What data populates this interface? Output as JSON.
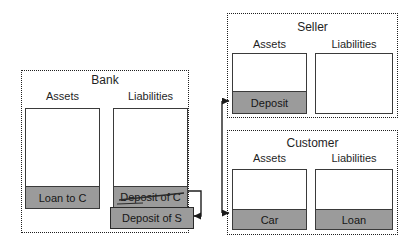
{
  "diagram": {
    "type": "balance-sheet-diagram",
    "groups": [
      {
        "title": "Bank",
        "columns": [
          {
            "header": "Assets",
            "items": [
              {
                "label": "Loan to C",
                "struck": false
              }
            ]
          },
          {
            "header": "Liabilities",
            "items": [
              {
                "label": "Deposit of C",
                "struck": true
              },
              {
                "label": "Deposit of S",
                "struck": false
              }
            ]
          }
        ]
      },
      {
        "title": "Seller",
        "columns": [
          {
            "header": "Assets",
            "items": [
              {
                "label": "Deposit",
                "struck": false
              }
            ]
          },
          {
            "header": "Liabilities",
            "items": []
          }
        ]
      },
      {
        "title": "Customer",
        "columns": [
          {
            "header": "Assets",
            "items": [
              {
                "label": "Car",
                "struck": false
              }
            ]
          },
          {
            "header": "Liabilities",
            "items": [
              {
                "label": "Loan",
                "struck": false
              }
            ]
          }
        ]
      }
    ],
    "connectors": [
      {
        "name": "deposit-reassignment-arrow",
        "from": "Deposit of C",
        "to": "Deposit of S"
      },
      {
        "name": "transaction-connector-arrow",
        "endpoints": [
          "Deposit",
          "Car"
        ]
      }
    ],
    "colors": {
      "band_fill": "#9b9b9b",
      "box_outline": "#3a3a3a",
      "dotted_border": "#1f1f1f",
      "arrow": "#1a1a1a",
      "text": "#1f1f1f",
      "background": "#ffffff"
    }
  }
}
